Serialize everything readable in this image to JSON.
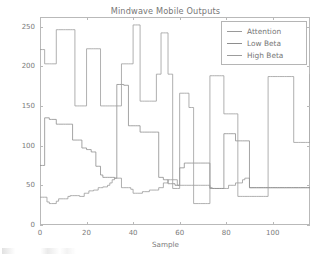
{
  "chart_data": {
    "type": "line",
    "title": "Mindwave Mobile Outputs",
    "xlabel": "Sample",
    "ylabel": "Amplitude",
    "xlim": [
      0,
      116
    ],
    "ylim": [
      0,
      262
    ],
    "xticks": [
      0,
      20,
      40,
      60,
      80,
      100
    ],
    "yticks": [
      0,
      50,
      100,
      150,
      200,
      250
    ],
    "xtick_labels": [
      "0",
      "20",
      "40",
      "60",
      "80",
      "100"
    ],
    "ytick_labels": [
      "0",
      "50",
      "100",
      "150",
      "200",
      "250"
    ],
    "grid": false,
    "legend_position": "upper right",
    "drawstyle": "steps-post",
    "series": [
      {
        "name": "Attention",
        "color": "#9a9a9a",
        "values": [
          35,
          35,
          35,
          29,
          27,
          27,
          27,
          30,
          33,
          33,
          33,
          33,
          36,
          37,
          37,
          37,
          37,
          36,
          36,
          40,
          40,
          43,
          43,
          44,
          44,
          47,
          47,
          48,
          48,
          50,
          53,
          57,
          59,
          59,
          59,
          47,
          47,
          47,
          47,
          45,
          40,
          40,
          40,
          40,
          42,
          42,
          42,
          44,
          44,
          44,
          44,
          47,
          47,
          53,
          53,
          57,
          57,
          57,
          57,
          50,
          50,
          50,
          50,
          50,
          50,
          50,
          50,
          50,
          50,
          50,
          50,
          50,
          50,
          47,
          46,
          46,
          46,
          46,
          46,
          46,
          46,
          50,
          50,
          50,
          53,
          53,
          53,
          57,
          59,
          59,
          47,
          47,
          47,
          47,
          47,
          47,
          47,
          47,
          47,
          47,
          47,
          47,
          47,
          47,
          47,
          47,
          47,
          47,
          47,
          47,
          47,
          47,
          47,
          47,
          47,
          47,
          47
        ]
      },
      {
        "name": "Low Beta",
        "color": "#8e8e8e",
        "values": [
          75,
          75,
          135,
          135,
          133,
          133,
          133,
          127,
          127,
          127,
          127,
          127,
          127,
          127,
          107,
          107,
          107,
          107,
          97,
          97,
          95,
          95,
          92,
          92,
          74,
          74,
          63,
          60,
          60,
          60,
          60,
          60,
          59,
          177,
          177,
          177,
          176,
          176,
          125,
          125,
          125,
          125,
          125,
          117,
          117,
          117,
          117,
          117,
          117,
          117,
          117,
          60,
          60,
          57,
          57,
          52,
          52,
          52,
          50,
          50,
          72,
          72,
          78,
          78,
          78,
          78,
          78,
          78,
          78,
          78,
          78,
          78,
          78,
          46,
          46,
          46,
          46,
          46,
          46,
          115,
          115,
          115,
          115,
          115,
          106,
          106,
          106,
          106,
          106,
          106,
          47,
          47,
          47,
          47,
          47,
          47,
          47,
          47,
          47,
          47,
          47,
          47,
          47,
          47,
          47,
          47,
          47,
          47,
          47,
          47,
          47,
          47,
          47,
          47,
          47,
          47,
          47
        ]
      },
      {
        "name": "High Beta",
        "color": "#9c9c9c",
        "values": [
          221,
          221,
          203,
          203,
          203,
          203,
          203,
          246,
          246,
          246,
          246,
          246,
          246,
          246,
          246,
          150,
          150,
          150,
          150,
          150,
          222,
          222,
          222,
          222,
          222,
          222,
          150,
          150,
          150,
          150,
          150,
          150,
          150,
          150,
          150,
          203,
          203,
          203,
          203,
          203,
          252,
          252,
          252,
          156,
          156,
          156,
          156,
          156,
          156,
          156,
          190,
          190,
          242,
          242,
          242,
          190,
          190,
          46,
          46,
          46,
          166,
          166,
          166,
          166,
          148,
          148,
          27,
          27,
          27,
          27,
          27,
          27,
          27,
          188,
          188,
          188,
          188,
          188,
          188,
          140,
          140,
          140,
          140,
          140,
          140,
          36,
          36,
          36,
          36,
          36,
          36,
          36,
          36,
          36,
          36,
          36,
          36,
          36,
          187,
          187,
          187,
          187,
          187,
          187,
          187,
          187,
          187,
          187,
          187,
          104,
          104,
          104,
          104,
          104,
          104,
          104,
          190
        ]
      }
    ]
  },
  "legend": {
    "items": [
      {
        "label": "Attention"
      },
      {
        "label": "Low Beta"
      },
      {
        "label": "High Beta"
      }
    ]
  }
}
